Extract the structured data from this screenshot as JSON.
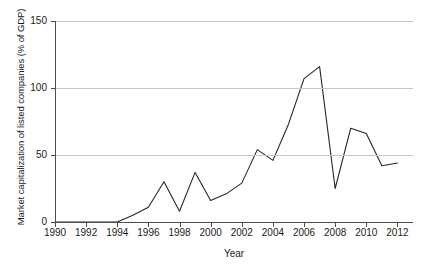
{
  "chart_data": {
    "type": "line",
    "title": "",
    "xlabel": "Year",
    "ylabel": "Market capitalization of listed companies (% of GDP)",
    "xlim": [
      1990,
      2013
    ],
    "ylim": [
      0,
      150
    ],
    "xticks": [
      1990,
      1992,
      1994,
      1996,
      1998,
      2000,
      2002,
      2004,
      2006,
      2008,
      2010,
      2012
    ],
    "yticks": [
      0,
      50,
      100,
      150
    ],
    "grid": "horizontal",
    "legend": "none",
    "line_color": "#262626",
    "x": [
      1990,
      1991,
      1992,
      1993,
      1994,
      1995,
      1996,
      1997,
      1998,
      1999,
      2000,
      2001,
      2002,
      2003,
      2004,
      2005,
      2006,
      2007,
      2008,
      2009,
      2010,
      2011,
      2012
    ],
    "series": [
      {
        "name": "Market capitalization of listed companies (% of GDP)",
        "values": [
          0,
          0,
          0,
          0,
          0,
          5,
          11,
          30,
          8,
          37,
          16,
          21,
          29,
          54,
          46,
          73,
          107,
          116,
          25,
          70,
          66,
          42,
          44
        ]
      }
    ]
  },
  "axes": {
    "y_tick_labels": [
      "150",
      "100",
      "50",
      "0"
    ],
    "x_tick_labels": [
      "1990",
      "1992",
      "1994",
      "1996",
      "1998",
      "2000",
      "2002",
      "2004",
      "2006",
      "2008",
      "2010",
      "2012"
    ],
    "y_axis_title": "Market capitalization of listed companies (% of GDP)",
    "x_axis_title": "Year"
  }
}
